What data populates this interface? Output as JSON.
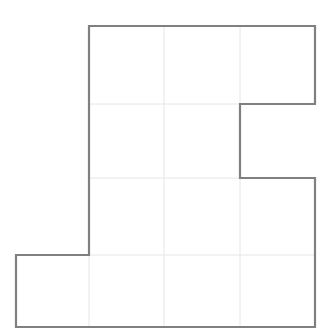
{
  "figure": {
    "name": "grid-polyomino-outline",
    "canvas": {
      "width": 336,
      "height": 333,
      "background": "#ffffff"
    },
    "colors": {
      "outline": "#808080",
      "gridline": "#e6e6e6",
      "fill": "#ffffff"
    },
    "stroke": {
      "outline_width": 2.2,
      "gridline_width": 1
    },
    "grid": {
      "x_positions": [
        16,
        89,
        164,
        240,
        315
      ],
      "y_positions": [
        26,
        104,
        178,
        255,
        327
      ],
      "columns": 4,
      "rows": 4,
      "cell_width": 75,
      "cell_height": 75
    },
    "cells": [
      {
        "row": 0,
        "col": 1,
        "filled": true
      },
      {
        "row": 0,
        "col": 2,
        "filled": true
      },
      {
        "row": 0,
        "col": 3,
        "filled": true
      },
      {
        "row": 1,
        "col": 1,
        "filled": true
      },
      {
        "row": 1,
        "col": 2,
        "filled": true
      },
      {
        "row": 1,
        "col": 3,
        "filled": false
      },
      {
        "row": 2,
        "col": 1,
        "filled": true
      },
      {
        "row": 2,
        "col": 2,
        "filled": true
      },
      {
        "row": 2,
        "col": 3,
        "filled": true
      },
      {
        "row": 3,
        "col": 0,
        "filled": true
      },
      {
        "row": 3,
        "col": 1,
        "filled": true
      },
      {
        "row": 3,
        "col": 2,
        "filled": true
      },
      {
        "row": 3,
        "col": 3,
        "filled": true
      }
    ],
    "filled_cell_count": 12,
    "outline_path": "M 89 26 L 315 26 L 315 104 L 240 104 L 240 178 L 315 178 L 315 327 L 16 327 L 16 255 L 89 255 Z",
    "interior_segments": [
      {
        "name": "vertical-grid-col-2-upper",
        "x1": 164,
        "y1": 26,
        "x2": 164,
        "y2": 327
      },
      {
        "name": "vertical-grid-col-3-upper",
        "x1": 240,
        "y1": 26,
        "x2": 240,
        "y2": 104
      },
      {
        "name": "vertical-grid-col-3-lower",
        "x1": 240,
        "y1": 178,
        "x2": 240,
        "y2": 327
      },
      {
        "name": "vertical-grid-col-1-bottom",
        "x1": 89,
        "y1": 255,
        "x2": 89,
        "y2": 327
      },
      {
        "name": "horizontal-grid-row-1",
        "x1": 89,
        "y1": 104,
        "x2": 240,
        "y2": 104
      },
      {
        "name": "horizontal-grid-row-2",
        "x1": 89,
        "y1": 178,
        "x2": 240,
        "y2": 178
      },
      {
        "name": "horizontal-grid-row-3",
        "x1": 16,
        "y1": 255,
        "x2": 315,
        "y2": 255
      }
    ]
  }
}
